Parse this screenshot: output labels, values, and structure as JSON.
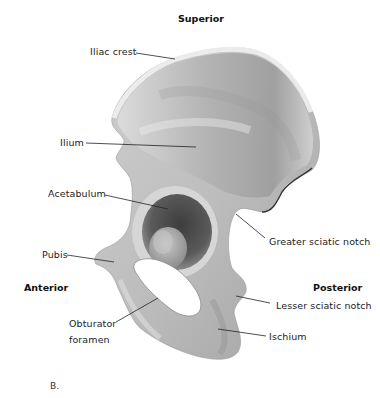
{
  "figure": {
    "panel_label": "B."
  },
  "orientation": {
    "superior": "Superior",
    "anterior": "Anterior",
    "posterior": "Posterior"
  },
  "labels": {
    "iliac_crest": "Iliac crest",
    "ilium": "Ilium",
    "acetabulum": "Acetabulum",
    "greater_sciatic_notch": "Greater sciatic notch",
    "pubis": "Pubis",
    "lesser_sciatic_notch": "Lesser sciatic notch",
    "obturator_foramen_line1": "Obturator",
    "obturator_foramen_line2": "foramen",
    "ischium": "Ischium"
  },
  "colors": {
    "bone_light": "#e6e6e6",
    "bone_mid": "#bdbdbd",
    "bone_dark": "#7c7c7c",
    "leader_line": "#222222",
    "background": "#ffffff"
  }
}
